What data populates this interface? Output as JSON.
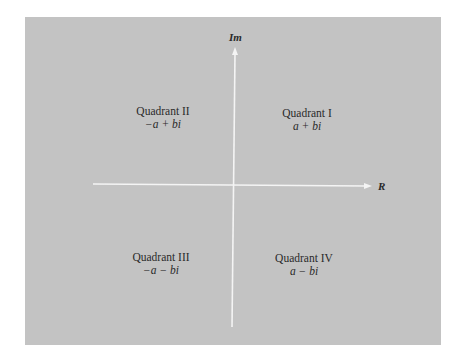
{
  "diagram": {
    "axes": {
      "vertical_label": "Im",
      "horizontal_label": "R"
    },
    "quadrants": [
      {
        "name": "Quadrant I",
        "expr": "a + bi"
      },
      {
        "name": "Quadrant II",
        "expr": "−a + bi"
      },
      {
        "name": "Quadrant III",
        "expr": "−a − bi"
      },
      {
        "name": "Quadrant IV",
        "expr": "a − bi"
      }
    ],
    "colors": {
      "panel": "#c3c3c3",
      "axis": "#f4f4f4",
      "text": "#2a2a2a"
    }
  }
}
